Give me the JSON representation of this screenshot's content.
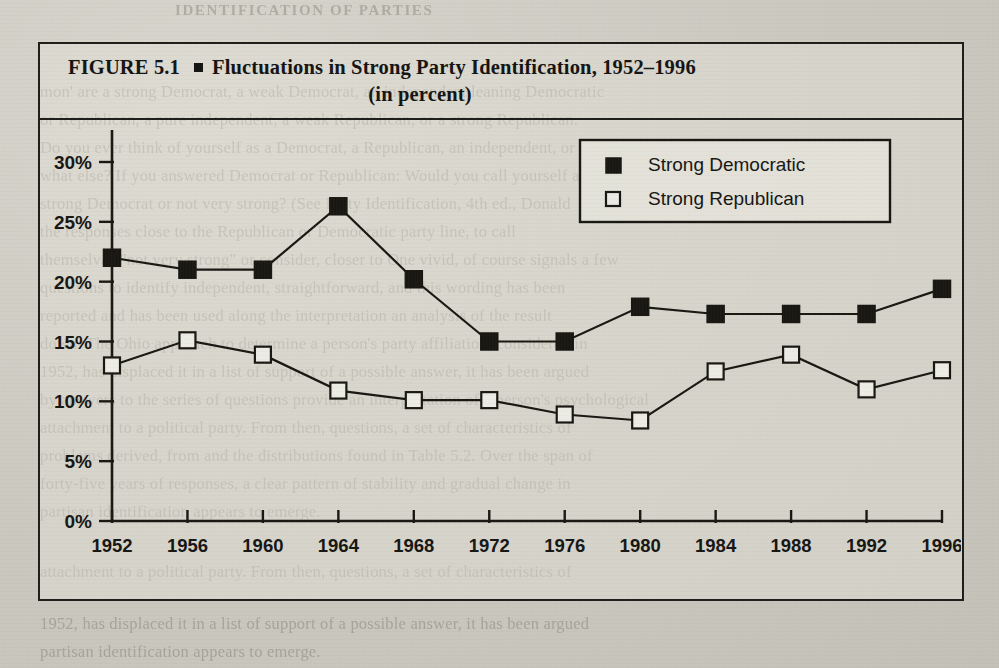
{
  "figure": {
    "label": "FIGURE 5.1",
    "title_line1": "Fluctuations in Strong Party Identification, 1952–1996",
    "title_line2": "(in percent)",
    "bullet": "square-bullet"
  },
  "legend": {
    "position": "top-right-inside",
    "items": [
      {
        "label": "Strong Democratic",
        "marker": "filled-square",
        "color": "#16150f"
      },
      {
        "label": "Strong Republican",
        "marker": "open-square",
        "color": "#ffffff"
      }
    ]
  },
  "chart_data": {
    "type": "line",
    "title": "Fluctuations in Strong Party Identification, 1952–1996 (in percent)",
    "xlabel": "",
    "ylabel": "",
    "grid": false,
    "legend_position": "top-right",
    "categories": [
      1952,
      1956,
      1960,
      1964,
      1968,
      1972,
      1976,
      1980,
      1984,
      1988,
      1992,
      1996
    ],
    "x_tick_labels": [
      "1952",
      "1956",
      "1960",
      "1964",
      "1968",
      "1972",
      "1976",
      "1980",
      "1984",
      "1988",
      "1992",
      "1996"
    ],
    "y_tick_labels": [
      "30%",
      "25%",
      "20%",
      "15%",
      "10%",
      "5%",
      "0%"
    ],
    "y_tick_values": [
      30,
      25,
      20,
      15,
      10,
      5,
      0
    ],
    "ylim": [
      0,
      30
    ],
    "xlim": [
      1952,
      1996
    ],
    "series": [
      {
        "name": "Strong Democratic",
        "marker": "filled-square",
        "values": [
          22.0,
          21.0,
          21.0,
          26.3,
          20.2,
          15.0,
          15.0,
          17.9,
          17.3,
          17.3,
          17.3,
          19.4
        ]
      },
      {
        "name": "Strong Republican",
        "marker": "open-square",
        "values": [
          13.0,
          15.1,
          13.9,
          10.9,
          10.1,
          10.1,
          8.9,
          8.4,
          12.5,
          13.9,
          11.0,
          12.6
        ]
      }
    ]
  },
  "background_text": {
    "header": "IDENTIFICATION OF PARTIES",
    "lines": [
      "mon' are a strong Democrat, a weak Democrat, an independent leaning Democratic",
      "or Republican, a pure independent, a weak Republican, or a strong Republican.",
      "Do you ever think of yourself as a Democrat, a Republican, an independent, or",
      "what else? If you answered Democrat or Republican: Would you call yourself a",
      "strong Democrat or not very strong? (See Party Identification, 4th ed., Donald",
      "the responses close to the Republican or Democratic party line, to call",
      "themselves \"not very strong\" or consider, closer to One vivid, of course signals a few",
      "questions to identify independent, straightforward, and this wording has been",
      "reported and has been used along the interpretation an analysis of the result",
      "down. The Ohio approach to determine a person's party affiliation, considered in",
      "1952, has displaced it in a list of support of a possible answer, it has been argued",
      "by answers to the series of questions provide an interpretation of a person's psychological",
      "attachment to a political party. From then, questions, a set of characteristics of",
      "problems derived, from and the distributions found in Table 5.2. Over the span of",
      "forty-five years of responses, a clear pattern of stability and gradual change in",
      "partisan identification appears to emerge."
    ]
  }
}
